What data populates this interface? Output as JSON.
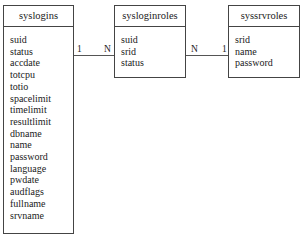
{
  "diagram": {
    "type": "entity-relationship",
    "entities": [
      {
        "name": "syslogins",
        "fields": [
          "suid",
          "status",
          "accdate",
          "totcpu",
          "totio",
          "spacelimit",
          "timelimit",
          "resultlimit",
          "dbname",
          "name",
          "password",
          "language",
          "pwdate",
          "audflags",
          "fullname",
          "srvname"
        ]
      },
      {
        "name": "sysloginroles",
        "fields": [
          "suid",
          "srid",
          "status"
        ]
      },
      {
        "name": "syssrvroles",
        "fields": [
          "srid",
          "name",
          "password"
        ]
      }
    ],
    "relationships": [
      {
        "from": "syslogins",
        "to": "sysloginroles",
        "from_cardinality": "1",
        "to_cardinality": "N"
      },
      {
        "from": "sysloginroles",
        "to": "syssrvroles",
        "from_cardinality": "N",
        "to_cardinality": "1"
      }
    ]
  }
}
